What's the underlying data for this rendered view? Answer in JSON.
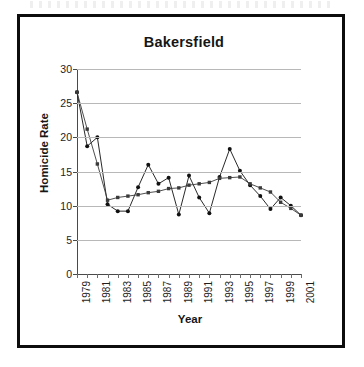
{
  "figure": {
    "title": "Bakersfield",
    "xlabel": "Year",
    "ylabel": "Homicide Rate"
  },
  "chart_data": {
    "type": "line",
    "title": "Bakersfield",
    "xlabel": "Year",
    "ylabel": "Homicide Rate",
    "grid": true,
    "legend": "none",
    "xlim": [
      1979,
      2001
    ],
    "ylim": [
      0,
      30
    ],
    "yticks": [
      0,
      5,
      10,
      15,
      20,
      25,
      30
    ],
    "xticks": [
      1979,
      1981,
      1983,
      1985,
      1987,
      1989,
      1991,
      1993,
      1995,
      1997,
      1999,
      2001
    ],
    "xtick_labels": [
      "1979",
      "1981",
      "1983",
      "1985",
      "1987",
      "1989",
      "1991",
      "1993",
      "1995",
      "1997",
      "1999",
      "2001"
    ],
    "x": [
      1979,
      1980,
      1981,
      1982,
      1983,
      1984,
      1985,
      1986,
      1987,
      1988,
      1989,
      1990,
      1991,
      1992,
      1993,
      1994,
      1995,
      1996,
      1997,
      1998,
      1999,
      2000,
      2001
    ],
    "series": [
      {
        "name": "Homicide Rate",
        "marker": "circle",
        "color": "#111111",
        "values": [
          26.6,
          18.7,
          20.0,
          10.2,
          9.2,
          9.2,
          12.7,
          16.0,
          13.2,
          14.1,
          8.7,
          14.4,
          11.2,
          8.9,
          14.2,
          18.3,
          15.1,
          13.0,
          11.4,
          9.5,
          11.2,
          10.0,
          8.6
        ]
      },
      {
        "name": "Trend",
        "marker": "square",
        "color": "#3a3a3a",
        "values": [
          26.6,
          21.2,
          16.1,
          10.8,
          11.2,
          11.4,
          11.6,
          11.9,
          12.1,
          12.5,
          12.6,
          13.0,
          13.2,
          13.4,
          14.0,
          14.1,
          14.2,
          13.2,
          12.6,
          12.0,
          10.5,
          9.6,
          8.6
        ]
      }
    ]
  }
}
